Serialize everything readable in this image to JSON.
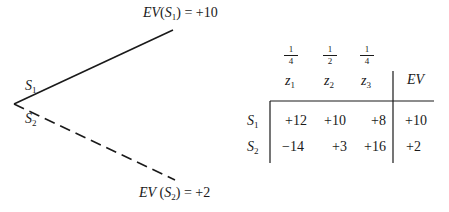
{
  "tree": {
    "branches": [
      {
        "name": "S",
        "sub": "1",
        "style": "solid"
      },
      {
        "name": "S",
        "sub": "2",
        "style": "dashed"
      }
    ],
    "outcomes": [
      {
        "prefix": "EV(",
        "strategy": "S",
        "sub": "1",
        "suffix": ") = +10"
      },
      {
        "prefix": "EV (",
        "strategy": "S",
        "sub": "2",
        "suffix": ") = +2"
      }
    ]
  },
  "table": {
    "probabilities": [
      {
        "num": "1",
        "den": "4"
      },
      {
        "num": "1",
        "den": "2"
      },
      {
        "num": "1",
        "den": "4"
      }
    ],
    "columns": [
      {
        "name": "z",
        "sub": "1"
      },
      {
        "name": "z",
        "sub": "2"
      },
      {
        "name": "z",
        "sub": "3"
      }
    ],
    "ev_header": "EV",
    "rows": [
      {
        "name": "S",
        "sub": "1",
        "values": [
          "+12",
          "+10",
          "+8"
        ],
        "ev": "+10"
      },
      {
        "name": "S",
        "sub": "2",
        "values": [
          "−14",
          "+3",
          "+16"
        ],
        "ev": "+2"
      }
    ]
  }
}
